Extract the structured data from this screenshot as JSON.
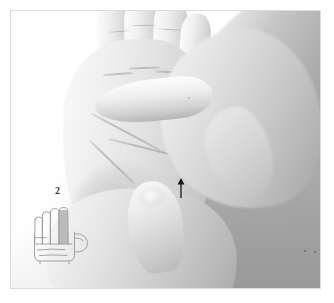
{
  "figure": {
    "media_type": "grayscale-photograph",
    "frame": {
      "border_color": "#dcdcdc",
      "background_color": "#ffffff"
    },
    "annotations": {
      "point_marker": {
        "name": "treatment-point-arrow",
        "symbol": "↑",
        "direction": "up",
        "color": "#1a1a1a"
      }
    }
  },
  "inset": {
    "label": "2",
    "label_color": "#3c3c3c",
    "caption_digit": "2",
    "diagram_name": "palm-outline-diagram",
    "highlighted_digit": "index-finger",
    "highlight_color": "#a8a8a8",
    "outline_color": "#9a9a9a",
    "fingers": [
      {
        "name": "thumb",
        "highlighted": false
      },
      {
        "name": "index-finger",
        "highlighted": true
      },
      {
        "name": "middle-finger",
        "highlighted": false
      },
      {
        "name": "ring-finger",
        "highlighted": false
      },
      {
        "name": "little-finger",
        "highlighted": false
      }
    ]
  },
  "photo": {
    "hands": [
      {
        "name": "patient-palm",
        "role": "treated"
      },
      {
        "name": "practitioner-upper-hand",
        "role": "stabilising"
      },
      {
        "name": "practitioner-lower-hand",
        "role": "mobilising"
      },
      {
        "name": "practitioner-pressing-thumb",
        "role": "applies-pressure"
      }
    ],
    "tones": {
      "highlight": "#fafafa",
      "midtone": "#c8c8c8",
      "shadow": "#8f8f8f",
      "background": "#ffffff"
    }
  }
}
